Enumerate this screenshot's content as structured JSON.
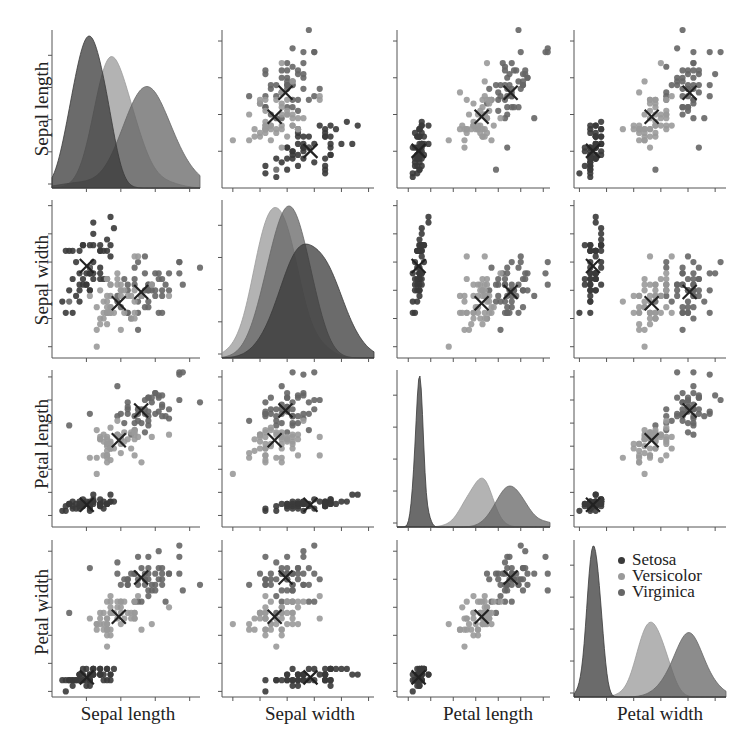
{
  "chart_data": {
    "type": "scatter",
    "title": "",
    "subtitle": "Iris pairplot (scatter matrix) with KDE diagonals and class centroids (X markers)",
    "variables": [
      "Sepal length",
      "Sepal width",
      "Petal length",
      "Petal width"
    ],
    "axis_labels": {
      "x": [
        "Sepal length",
        "Sepal width",
        "Petal length",
        "Petal width"
      ],
      "y": [
        "Sepal length",
        "Sepal width",
        "Petal length",
        "Petal width"
      ]
    },
    "ranges": {
      "Sepal length": [
        4.0,
        8.3
      ],
      "Sepal width": [
        1.8,
        4.6
      ],
      "Petal length": [
        0.5,
        7.3
      ],
      "Petal width": [
        -0.1,
        2.7
      ]
    },
    "ticks": {
      "Sepal length": [
        5,
        6,
        7,
        8
      ],
      "Sepal width": [
        2,
        2.5,
        3,
        3.5,
        4,
        4.5
      ],
      "Petal length": [
        1,
        2,
        3,
        4,
        5,
        6,
        7
      ],
      "Petal width": [
        0,
        0.5,
        1,
        1.5,
        2,
        2.5
      ]
    },
    "tick_labels_visible": false,
    "diagonal": "kde",
    "offdiagonal": "scatter",
    "legend": {
      "position": "inside bottom-right panel, upper area",
      "entries": [
        "Setosa",
        "Versicolor",
        "Virginica"
      ]
    },
    "grid": false,
    "series": [
      {
        "name": "Setosa",
        "color": "#3a3a3a",
        "centroid": {
          "Sepal length": 5.01,
          "Sepal width": 3.43,
          "Petal length": 1.46,
          "Petal width": 0.25
        },
        "std": {
          "Sepal length": 0.35,
          "Sepal width": 0.38,
          "Petal length": 0.17,
          "Petal width": 0.11
        }
      },
      {
        "name": "Versicolor",
        "color": "#9a9a9a",
        "centroid": {
          "Sepal length": 5.94,
          "Sepal width": 2.77,
          "Petal length": 4.26,
          "Petal width": 1.33
        },
        "std": {
          "Sepal length": 0.52,
          "Sepal width": 0.31,
          "Petal length": 0.47,
          "Petal width": 0.2
        }
      },
      {
        "name": "Virginica",
        "color": "#666666",
        "centroid": {
          "Sepal length": 6.59,
          "Sepal width": 2.97,
          "Petal length": 5.55,
          "Petal width": 2.03
        },
        "std": {
          "Sepal length": 0.64,
          "Sepal width": 0.32,
          "Petal length": 0.55,
          "Petal width": 0.27
        }
      }
    ]
  },
  "legend": {
    "items": [
      {
        "label": "Setosa",
        "color": "#3a3a3a"
      },
      {
        "label": "Versicolor",
        "color": "#9a9a9a"
      },
      {
        "label": "Virginica",
        "color": "#666666"
      }
    ]
  },
  "labels": {
    "row": [
      "Sepal length",
      "Sepal width",
      "Petal length",
      "Petal width"
    ],
    "col": [
      "Sepal length",
      "Sepal width",
      "Petal length",
      "Petal width"
    ]
  }
}
